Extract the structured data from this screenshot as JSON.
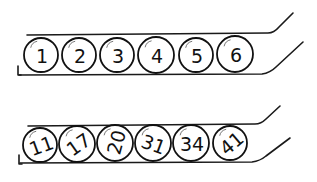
{
  "illustration": {
    "title": "",
    "colors": {
      "ink": "#111111",
      "background": "#ffffff",
      "highlight": "#777777"
    },
    "tubes": [
      {
        "label": "top-tube",
        "balls": [
          {
            "number": "1",
            "cx": 41,
            "cy": 55,
            "r": 17,
            "rot": 0
          },
          {
            "number": "2",
            "cx": 79,
            "cy": 55,
            "r": 17,
            "rot": 0
          },
          {
            "number": "3",
            "cx": 117,
            "cy": 55,
            "r": 17,
            "rot": 0
          },
          {
            "number": "4",
            "cx": 156,
            "cy": 55,
            "r": 18,
            "rot": 0
          },
          {
            "number": "5",
            "cx": 196,
            "cy": 55,
            "r": 17,
            "rot": 0
          },
          {
            "number": "6",
            "cx": 235,
            "cy": 54,
            "r": 18,
            "rot": 0
          }
        ]
      },
      {
        "label": "bottom-tube",
        "balls": [
          {
            "number": "11",
            "cx": 40,
            "cy": 145,
            "r": 17,
            "rot": -20
          },
          {
            "number": "17",
            "cx": 77,
            "cy": 144,
            "r": 18,
            "rot": -35
          },
          {
            "number": "20",
            "cx": 115,
            "cy": 143,
            "r": 18,
            "rot": -75
          },
          {
            "number": "31",
            "cx": 153,
            "cy": 143,
            "r": 18,
            "rot": 20
          },
          {
            "number": "34",
            "cx": 191,
            "cy": 143,
            "r": 18,
            "rot": 0
          },
          {
            "number": "41",
            "cx": 230,
            "cy": 143,
            "r": 17,
            "rot": -40
          }
        ]
      }
    ]
  }
}
